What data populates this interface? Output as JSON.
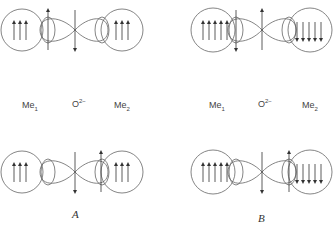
{
  "labels": {
    "left": {
      "me1": "Me",
      "me1_sub": "1",
      "o": "O",
      "o_sup": "2−",
      "me2": "Me",
      "me2_sub": "2"
    },
    "right": {
      "me1": "Me",
      "me1_sub": "1",
      "o": "O",
      "o_sup": "2−",
      "me2": "Me",
      "me2_sub": "2"
    }
  },
  "captions": {
    "a": "A",
    "b": "B"
  },
  "panels": [
    {
      "id": "top-left",
      "left_spins": [
        "up",
        "up",
        "up"
      ],
      "left_lobe_spin": "up",
      "center_spin": "down",
      "right_lobe_spin": null,
      "right_spins": [
        "up",
        "up",
        "up"
      ]
    },
    {
      "id": "top-right",
      "left_spins": [
        "up",
        "up",
        "up",
        "up",
        "up"
      ],
      "left_lobe_spin": "down",
      "center_spin": "up",
      "right_lobe_spin": null,
      "right_spins": [
        "down",
        "down",
        "down",
        "down",
        "down"
      ]
    },
    {
      "id": "bottom-left",
      "left_spins": [
        "up",
        "up",
        "up"
      ],
      "left_lobe_spin": null,
      "center_spin": "down",
      "right_lobe_spin": "up",
      "right_spins": [
        "up",
        "up",
        "up"
      ]
    },
    {
      "id": "bottom-right",
      "left_spins": [
        "up",
        "up",
        "up",
        "up",
        "up"
      ],
      "left_lobe_spin": null,
      "center_spin": "down",
      "right_lobe_spin": "up",
      "right_spins": [
        "down",
        "down",
        "down",
        "down",
        "down"
      ]
    }
  ],
  "colors": {
    "stroke": "#555555",
    "arrow": "#333333"
  }
}
